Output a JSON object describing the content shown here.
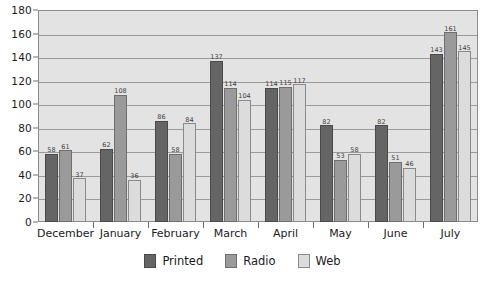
{
  "chart_data": {
    "type": "bar",
    "title": "",
    "subtitle": "",
    "xlabel": "",
    "ylabel": "",
    "categories": [
      "December",
      "January",
      "February",
      "March",
      "April",
      "May",
      "June",
      "July"
    ],
    "series": [
      {
        "name": "Printed",
        "color": "#656565",
        "values": [
          58,
          62,
          86,
          137,
          114,
          82,
          82,
          143
        ]
      },
      {
        "name": "Radio",
        "color": "#9a9a9a",
        "values": [
          61,
          108,
          58,
          114,
          115,
          53,
          51,
          161
        ]
      },
      {
        "name": "Web",
        "color": "#dcdcdc",
        "values": [
          37,
          36,
          84,
          104,
          117,
          58,
          46,
          145
        ]
      }
    ],
    "ylim": [
      0,
      180
    ],
    "y_ticks": [
      0,
      20,
      40,
      60,
      80,
      100,
      120,
      140,
      160,
      180
    ],
    "y_tick_labels": [
      "0",
      "20",
      "40",
      "60",
      "80",
      "100",
      "120",
      "140",
      "160",
      "180"
    ],
    "grid": true,
    "grid_axis": "y",
    "legend_position": "bottom",
    "show_value_labels": true,
    "plot_background": "#e3e3e3",
    "frame_color": "#8c8c8c"
  },
  "legend": {
    "items": [
      {
        "label": "Printed",
        "key": "printed"
      },
      {
        "label": "Radio",
        "key": "radio"
      },
      {
        "label": "Web",
        "key": "web"
      }
    ]
  }
}
